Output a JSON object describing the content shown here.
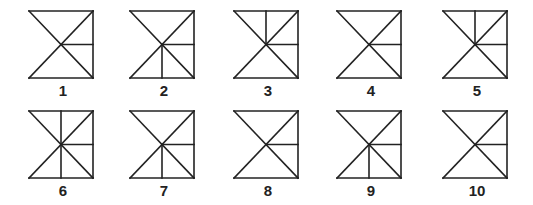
{
  "figures": [
    {
      "label": "1",
      "x": 28,
      "y": 10,
      "extras": []
    },
    {
      "label": "2",
      "x": 129,
      "y": 10,
      "extras": [
        "vdown"
      ]
    },
    {
      "label": "3",
      "x": 233,
      "y": 10,
      "extras": [
        "vup"
      ]
    },
    {
      "label": "4",
      "x": 336,
      "y": 10,
      "extras": []
    },
    {
      "label": "5",
      "x": 442,
      "y": 10,
      "extras": [
        "vup"
      ]
    },
    {
      "label": "6",
      "x": 28,
      "y": 110,
      "extras": [
        "vup",
        "vdown"
      ]
    },
    {
      "label": "7",
      "x": 129,
      "y": 110,
      "extras": [
        "vdown"
      ]
    },
    {
      "label": "8",
      "x": 233,
      "y": 110,
      "extras": []
    },
    {
      "label": "9",
      "x": 336,
      "y": 110,
      "extras": [
        "vdown"
      ]
    },
    {
      "label": "10",
      "x": 442,
      "y": 110,
      "extras": []
    }
  ],
  "stroke_color": "#222222"
}
